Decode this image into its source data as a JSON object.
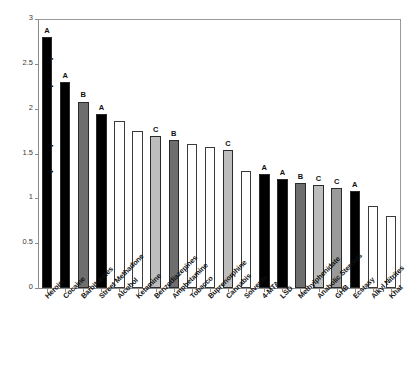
{
  "chart_data": {
    "type": "bar",
    "title": "",
    "subtitle": "",
    "xlabel": "",
    "ylabel": "Mean score (independent experts)",
    "ylim": [
      0,
      3
    ],
    "ytick_labels": [
      "0",
      "0.5",
      "1",
      "1.5",
      "2",
      "2.5",
      "3"
    ],
    "ytick_values": [
      0,
      0.5,
      1,
      1.5,
      2,
      2.5,
      3
    ],
    "grid": false,
    "legend": "none",
    "categories": [
      "Heroin",
      "Cocaine",
      "Barbiturates",
      "Street Methadone",
      "Alcohol",
      "Ketamine",
      "Benzodiazepines",
      "Amphetamine",
      "Tobacco",
      "Buprenorphine",
      "Cannabis",
      "Solvents",
      "4-MTA",
      "LSD",
      "Methylphenidate",
      "Anabolic Steroids",
      "GHB",
      "Ecstasy",
      "Alkyl Nitrites",
      "Khat"
    ],
    "values": [
      2.8,
      2.3,
      2.08,
      1.94,
      1.86,
      1.75,
      1.7,
      1.65,
      1.61,
      1.57,
      1.54,
      1.3,
      1.27,
      1.22,
      1.17,
      1.15,
      1.12,
      1.08,
      0.92,
      0.8
    ],
    "bar_colors": [
      "#000000",
      "#000000",
      "#6e6e6e",
      "#000000",
      "#ffffff",
      "#ffffff",
      "#bdbdbd",
      "#6e6e6e",
      "#ffffff",
      "#ffffff",
      "#bdbdbd",
      "#ffffff",
      "#000000",
      "#000000",
      "#6e6e6e",
      "#bdbdbd",
      "#9a9a9a",
      "#000000",
      "#ffffff",
      "#ffffff"
    ],
    "annotations": [
      "A",
      "A",
      "B",
      "A",
      "",
      "",
      "C",
      "B",
      "",
      "",
      "C",
      "",
      "A",
      "A",
      "B",
      "C",
      "C",
      "A",
      "",
      ""
    ]
  },
  "colors": {
    "black": "#000000",
    "dark_gray": "#6e6e6e",
    "mid_gray": "#9a9a9a",
    "light_gray": "#bdbdbd",
    "white": "#ffffff",
    "axis": "#8a8a8a",
    "text": "#111111"
  }
}
